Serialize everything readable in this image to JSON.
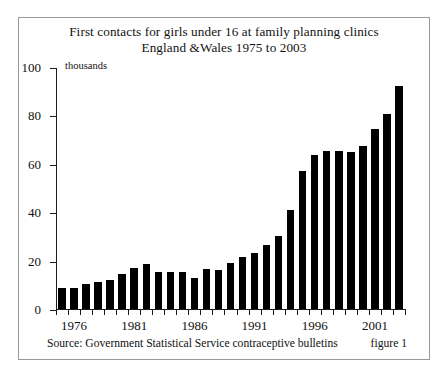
{
  "figure": {
    "title_line1": "First contacts for girls under 16 at family planning clinics",
    "title_line2": "England &Wales 1975 to 2003",
    "units_label": "thousands",
    "source": "Source: Government Statistical Service contraceptive bulletins",
    "figure_number": "figure 1",
    "border_color": "#9a9a9a",
    "bar_color": "#000000",
    "background": "#ffffff"
  },
  "chart_data": {
    "type": "bar",
    "title": "First contacts for girls under 16 at family planning clinics England &Wales 1975 to 2003",
    "xlabel": "",
    "ylabel": "thousands",
    "ylim": [
      0,
      100
    ],
    "yticks": [
      0,
      20,
      40,
      60,
      80,
      100
    ],
    "xticks": [
      1976,
      1981,
      1986,
      1991,
      1996,
      2001
    ],
    "grid": false,
    "legend": false,
    "categories": [
      1975,
      1976,
      1977,
      1978,
      1979,
      1980,
      1981,
      1982,
      1983,
      1984,
      1985,
      1986,
      1987,
      1988,
      1989,
      1990,
      1991,
      1992,
      1993,
      1994,
      1995,
      1996,
      1997,
      1998,
      1999,
      2000,
      2001,
      2002,
      2003
    ],
    "values": [
      8.5,
      8.7,
      10.5,
      11.0,
      12.0,
      14.5,
      17.0,
      18.5,
      15.5,
      15.5,
      15.5,
      13.0,
      16.5,
      16.0,
      19.0,
      21.5,
      23.0,
      26.5,
      30.0,
      41.0,
      57.0,
      63.5,
      65.5,
      65.5,
      65.0,
      67.5,
      74.5,
      80.5,
      92.0
    ]
  }
}
